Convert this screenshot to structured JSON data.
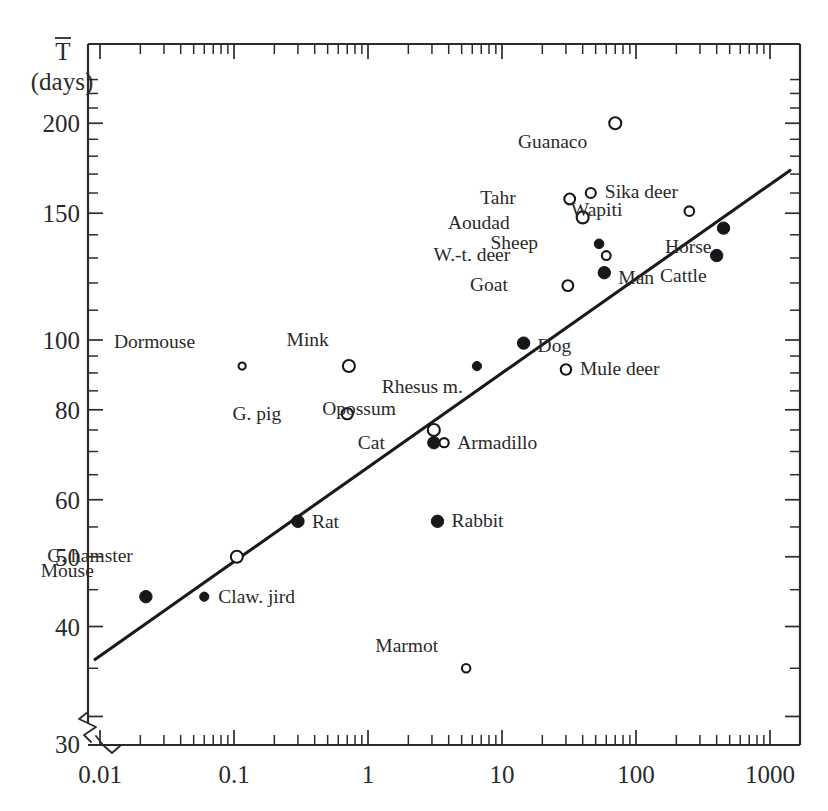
{
  "chart_data": {
    "type": "scatter",
    "title": "",
    "xlabel": "",
    "ylabel": "T (days)",
    "ylabel_symbol": "T̄",
    "ylabel_units": "(days)",
    "xscale": "log",
    "yscale": "log",
    "xlim": [
      0.01,
      1000
    ],
    "ylim": [
      30,
      230
    ],
    "grid": false,
    "legend": null,
    "xticks": [
      "0.01",
      "0.1",
      "1",
      "10",
      "100",
      "1000"
    ],
    "xtick_values": [
      0.01,
      0.1,
      1,
      10,
      100,
      1000
    ],
    "yticks": [
      "200",
      "150",
      "100",
      "80",
      "60",
      "50",
      "40",
      "30"
    ],
    "ytick_values": [
      200,
      150,
      100,
      80,
      60,
      50,
      40,
      30
    ],
    "axis_break": {
      "axis": "both",
      "note": "zigzag break near origin at 30 days / 0.01"
    },
    "trendline": {
      "label": "regression line",
      "x_start": 0.0105,
      "y_start": 36,
      "x_end": 1150,
      "y_end": 172
    },
    "points": [
      {
        "label": "Mouse",
        "marker": "filled",
        "x": 0.022,
        "y": 44,
        "label_dx": -52,
        "label_dy": -20
      },
      {
        "label": "Claw. jird",
        "marker": "filled",
        "x": 0.06,
        "y": 44,
        "label_dx": 14,
        "label_dy": 6
      },
      {
        "label": "G. hamster",
        "marker": "open",
        "x": 0.105,
        "y": 50,
        "label_dx": -104,
        "label_dy": 5
      },
      {
        "label": "Dormouse",
        "marker": "open",
        "x": 0.115,
        "y": 92,
        "label_dx": -47,
        "label_dy": -18
      },
      {
        "label": "Rat",
        "marker": "filled",
        "x": 0.3,
        "y": 56,
        "label_dx": 14,
        "label_dy": 7
      },
      {
        "label": "Mink",
        "marker": "open",
        "x": 0.72,
        "y": 92,
        "label_dx": -20,
        "label_dy": -20
      },
      {
        "label": "G. pig",
        "marker": "open",
        "x": 0.7,
        "y": 79,
        "label_dx": -66,
        "label_dy": 6
      },
      {
        "label": "Opossum",
        "marker": "open",
        "x": 3.1,
        "y": 75,
        "label_dx": -38,
        "label_dy": -15
      },
      {
        "label": "Cat",
        "marker": "filled",
        "x": 3.1,
        "y": 72,
        "label_dx": -49,
        "label_dy": 6
      },
      {
        "label": "Armadillo",
        "marker": "open",
        "x": 3.7,
        "y": 72,
        "label_dx": 13,
        "label_dy": 6
      },
      {
        "label": "Rabbit",
        "marker": "filled",
        "x": 3.3,
        "y": 56,
        "label_dx": 14,
        "label_dy": 6
      },
      {
        "label": "Marmot",
        "marker": "open",
        "x": 5.4,
        "y": 35,
        "label_dx": -28,
        "label_dy": -16
      },
      {
        "label": "Rhesus m.",
        "marker": "filled",
        "x": 6.5,
        "y": 92,
        "label_dx": -14,
        "label_dy": 27
      },
      {
        "label": "Dog",
        "marker": "filled",
        "x": 14.5,
        "y": 99,
        "label_dx": 14,
        "label_dy": 9
      },
      {
        "label": "Mule deer",
        "marker": "open",
        "x": 30,
        "y": 91,
        "label_dx": 14,
        "label_dy": 6
      },
      {
        "label": "Goat",
        "marker": "open",
        "x": 31,
        "y": 119,
        "label_dx": -60,
        "label_dy": 5
      },
      {
        "label": "Man",
        "marker": "filled",
        "x": 58,
        "y": 124,
        "label_dx": 14,
        "label_dy": 11
      },
      {
        "label": "W.-t. deer",
        "marker": "open",
        "x": 60,
        "y": 131,
        "label_dx": -96,
        "label_dy": 5
      },
      {
        "label": "Sheep",
        "marker": "filled",
        "x": 53,
        "y": 136,
        "label_dx": -61,
        "label_dy": 5
      },
      {
        "label": "Aoudad",
        "marker": "open",
        "x": 40,
        "y": 148,
        "label_dx": -73,
        "label_dy": 12
      },
      {
        "label": "Tahr",
        "marker": "open",
        "x": 32,
        "y": 157,
        "label_dx": -54,
        "label_dy": 5
      },
      {
        "label": "Sika deer",
        "marker": "open",
        "x": 46,
        "y": 160,
        "label_dx": 14,
        "label_dy": 5
      },
      {
        "label": "Wapiti",
        "marker": "open",
        "x": 250,
        "y": 151,
        "label_dx": -67,
        "label_dy": 5
      },
      {
        "label": "Guanaco",
        "marker": "open",
        "x": 70,
        "y": 200,
        "label_dx": -28,
        "label_dy": 25
      },
      {
        "label": "Horse",
        "marker": "filled",
        "x": 450,
        "y": 143,
        "label_dx": -12,
        "label_dy": 25
      },
      {
        "label": "Cattle",
        "marker": "filled",
        "x": 400,
        "y": 131,
        "label_dx": -10,
        "label_dy": 26
      }
    ]
  },
  "axes": {
    "y_symbol": "T",
    "y_units": "(days)",
    "x_tick_labels": [
      "0.01",
      "0.1",
      "1",
      "10",
      "100",
      "1000"
    ],
    "y_tick_labels": [
      "200",
      "150",
      "100",
      "80",
      "60",
      "50",
      "40",
      "30"
    ]
  },
  "colors": {
    "ink": "#1a1a1a",
    "axis": "#2b2b2b",
    "marker_fill": "#17171a",
    "marker_open": "#ffffff",
    "background": "#ffffff"
  }
}
